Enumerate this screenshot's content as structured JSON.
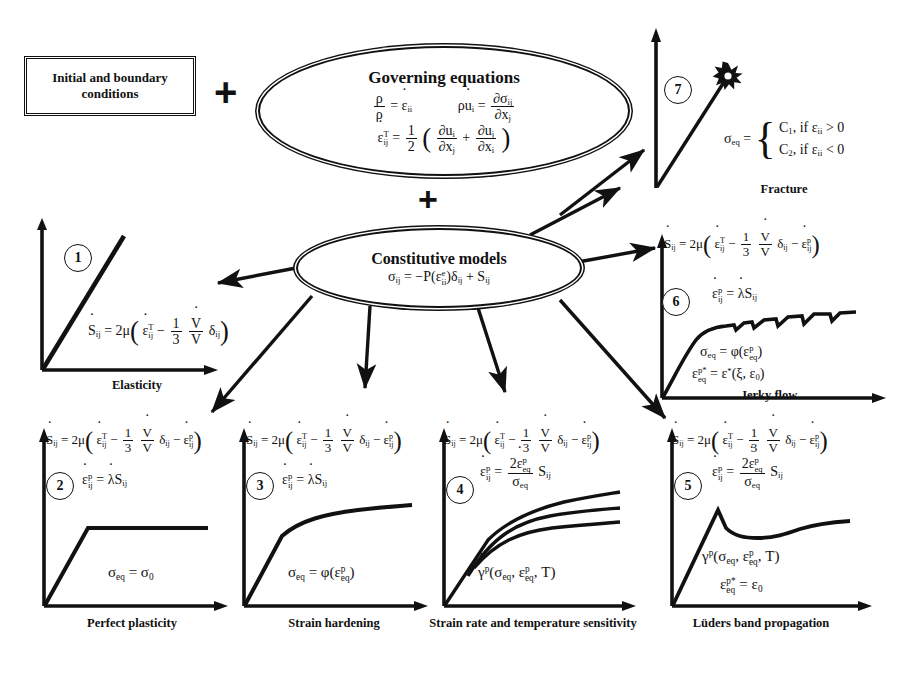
{
  "diagram": {
    "title_inputs": "Initial and boundary conditions",
    "plus_symbol": "+",
    "governing": {
      "title": "Governing equations",
      "equations": [
        "ρ̇/ρ = ε̇_ii",
        "ε̇_ij^T = 1/2 ( ∂u_i/∂x_j + ∂u_j/∂x_i )",
        "ρu̇_i = ∂σ_ij/∂x_j"
      ]
    },
    "constitutive": {
      "title": "Constitutive models",
      "equation": "σ̇_ij = −Ṗ(ε_ii^e)δ_ij + Ṡ_ij"
    }
  },
  "panels": [
    {
      "id": 1,
      "number": "1",
      "caption": "Elasticity",
      "curve": "linear-elastic",
      "equations": [
        "Ṡ_ij = 2μ( ε̇_ij^T − (1/3)(V̇/V)δ_ij )"
      ]
    },
    {
      "id": 2,
      "number": "2",
      "caption": "Perfect plasticity",
      "curve": "elastic-perfectly-plastic",
      "equations": [
        "Ṡ_ij = 2μ( ε̇_ij^T − (1/3)(V̇/V)δ_ij − ε̇_ij^p )",
        "ε̇_ij^p = λ̇S_ij",
        "σ_eq = σ_0"
      ]
    },
    {
      "id": 3,
      "number": "3",
      "caption": "Strain hardening",
      "curve": "hardening",
      "equations": [
        "Ṡ_ij = 2μ( ε̇_ij^T − (1/3)(V̇/V)δ_ij − ε̇_ij^p )",
        "ε̇_ij^p = λ̇S_ij",
        "σ_eq = φ(ε_eq^p)"
      ]
    },
    {
      "id": 4,
      "number": "4",
      "caption": "Strain rate and temperature sensitivity",
      "curve": "three-rate-curves",
      "equations": [
        "Ṡ_ij = 2μ( ε̇_ij^T − (1/3)(V̇/V)δ_ij − ε̇_ij^p )",
        "ε̇_ij^p = 2ε̇_eq^p/σ_eq S_ij",
        "γ̇^p(σ_eq, ε_eq^p, T)"
      ]
    },
    {
      "id": 5,
      "number": "5",
      "caption": "Lüders band propagation",
      "curve": "yield-point-drop",
      "equations": [
        "Ṡ_ij = 2μ( ε̇_ij^T − (1/3)(V̇/V)δ_ij − ε̇_ij^p )",
        "ε̇_ij^p = 2ε̇_eq^p/σ_eq S_ij",
        "γ̇^p(σ_eq, ε_eq^p, T)",
        "ε_eq^p* = ε_0"
      ]
    },
    {
      "id": 6,
      "number": "6",
      "caption": "Jerky flow",
      "curve": "serrated",
      "equations": [
        "Ṡ_ij = 2μ( ε̇_ij^T − (1/3)(V̇/V)δ_ij − ε̇_ij^p )",
        "ε̇_ij^p = λ̇S_ij",
        "σ_eq = φ(ε_eq^p)",
        "ε_eq^p* = ε*(ξ, ε_0)"
      ]
    },
    {
      "id": 7,
      "number": "7",
      "caption": "Fracture",
      "curve": "rising-to-burst",
      "equations": [
        "σ_eq = { C_1, if ε_ii > 0 ; C_2, if ε_ii < 0 }"
      ],
      "fracture_cases": [
        {
          "value": "C",
          "sub": "1",
          "condition": "if ε",
          "condsub": "ii",
          "rel": "> 0"
        },
        {
          "value": "C",
          "sub": "2",
          "condition": "if ε",
          "condsub": "ii",
          "rel": "< 0"
        }
      ]
    }
  ],
  "symbols": {
    "lambda": "λ",
    "mu": "μ",
    "sigma": "σ",
    "epsilon": "ε",
    "delta": "δ",
    "rho": "ρ",
    "phi": "φ",
    "gamma": "γ",
    "xi": "ξ",
    "partial": "∂"
  },
  "colors": {
    "ink": "#111111",
    "background": "#ffffff"
  }
}
